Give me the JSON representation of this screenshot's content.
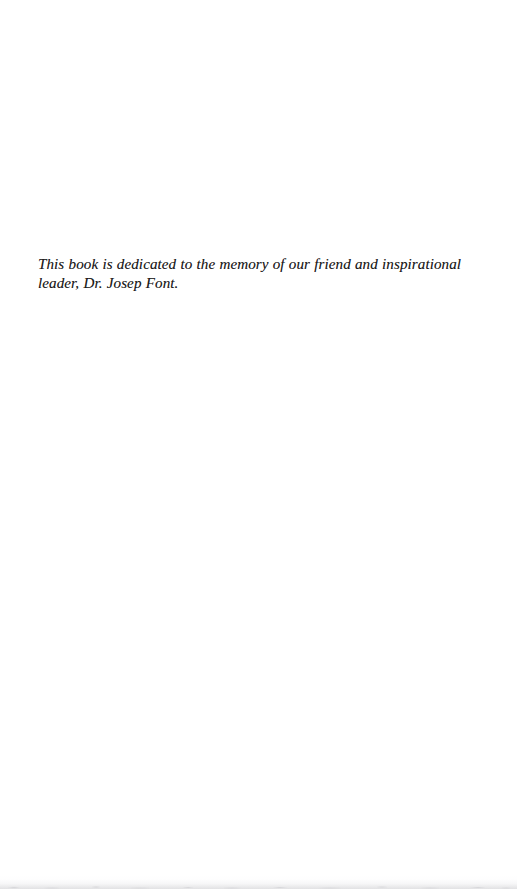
{
  "page": {
    "kind": "book-dedication-page",
    "background_color": "#ffffff",
    "ink_color": "#1c1a1a",
    "width_px": 517,
    "height_px": 889
  },
  "dedication": {
    "full_text": "This book is dedicated to the memory of our friend and inspirational leader, Dr. Josep Font.",
    "lines": [
      "This book is dedicated to the memory of our friend and inspirational",
      "leader, Dr. Josep Font."
    ],
    "honoree": "Dr. Josep Font",
    "style": "italic"
  },
  "artifacts": {
    "bottom_scan_edge": ""
  }
}
